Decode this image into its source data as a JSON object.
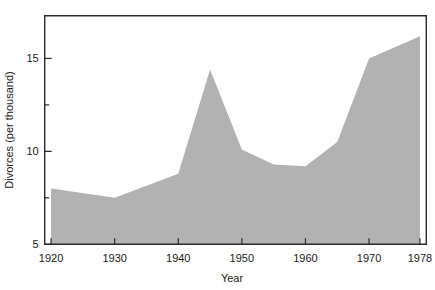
{
  "chart_data": {
    "type": "area",
    "title": "",
    "subtitle": "",
    "xlabel": "Year",
    "ylabel": "Divorces (per thousand)",
    "x": [
      1920,
      1930,
      1940,
      1945,
      1950,
      1955,
      1960,
      1965,
      1970,
      1978
    ],
    "values": [
      8.0,
      7.5,
      8.8,
      14.4,
      10.1,
      9.3,
      9.2,
      10.5,
      15.0,
      16.2
    ],
    "series": [
      {
        "name": "Divorces (per thousand)",
        "values": [
          8.0,
          7.5,
          8.8,
          14.4,
          10.1,
          9.3,
          9.2,
          10.5,
          15.0,
          16.2
        ]
      }
    ],
    "xlim": [
      1919,
      1979
    ],
    "ylim": [
      5,
      17.3
    ],
    "xticks": [
      1920,
      1930,
      1940,
      1950,
      1960,
      1970,
      1978
    ],
    "xtick_labels": [
      "1920",
      "1930",
      "1940",
      "1950",
      "1960",
      "1970",
      "1978"
    ],
    "yticks": [
      5,
      7.5,
      10,
      12.5,
      15
    ],
    "ytick_labels": [
      "5",
      "",
      "10",
      "",
      "15"
    ],
    "ytick_labels_visible": [
      "5",
      "10",
      "15"
    ],
    "grid": false,
    "legend": null,
    "legend_position": "none",
    "fill_color": "#b2b2b2",
    "axis_color": "#2b2b2b",
    "background_color": "#ffffff",
    "annotations": []
  },
  "axes": {
    "y_axis_title": "Divorces (per thousand)",
    "x_axis_title": "Year"
  },
  "y_tick_labels": [
    {
      "value": 15,
      "label": "15"
    },
    {
      "value": 10,
      "label": "10"
    },
    {
      "value": 5,
      "label": "5"
    }
  ],
  "x_tick_labels": [
    {
      "value": 1920,
      "label": "1920"
    },
    {
      "value": 1930,
      "label": "1930"
    },
    {
      "value": 1940,
      "label": "1940"
    },
    {
      "value": 1950,
      "label": "1950"
    },
    {
      "value": 1960,
      "label": "1960"
    },
    {
      "value": 1970,
      "label": "1970"
    },
    {
      "value": 1978,
      "label": "1978"
    }
  ]
}
